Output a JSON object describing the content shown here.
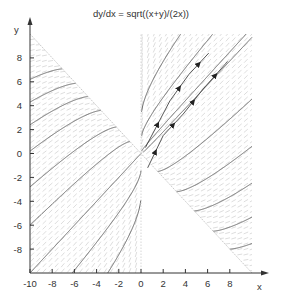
{
  "chart_data": {
    "type": "line",
    "title": "dy/dx = sqrt((x+y)/(2x))",
    "xlabel": "x",
    "ylabel": "y",
    "xlim": [
      -10,
      10
    ],
    "ylim": [
      -10,
      10
    ],
    "x_ticks": [
      -10,
      -8,
      -6,
      -4,
      -2,
      0,
      2,
      4,
      6,
      8
    ],
    "y_ticks": [
      -8,
      -6,
      -4,
      -2,
      0,
      2,
      4,
      6,
      8
    ],
    "grid": false,
    "legend": null,
    "annotations": [
      "slope field (direction field) shown in valid regions",
      "boundary line y = -x (dotted)",
      "boundary line x = 0 (dotted)"
    ],
    "solution_curves_right_start": [
      [
        0.05,
        0.2
      ],
      [
        0.2,
        0.1
      ],
      [
        0.05,
        1.5
      ],
      [
        1.5,
        -1.5
      ],
      [
        3.2,
        -3.2
      ],
      [
        4.8,
        -4.8
      ],
      [
        6.5,
        -6.5
      ],
      [
        8.0,
        -8.0
      ],
      [
        0.05,
        3.5
      ]
    ],
    "solution_curves_left_start": [
      [
        -10,
        6.2
      ],
      [
        -10,
        4.3
      ],
      [
        -10,
        2.4
      ],
      [
        -10,
        0.2
      ],
      [
        -10,
        -2.8
      ],
      [
        -10,
        -6.0
      ],
      [
        -10,
        -10.0
      ],
      [
        -6.2,
        -10
      ],
      [
        -3.0,
        -10
      ]
    ],
    "arrow_curves": [
      {
        "points": [
          [
            0.4,
            0.5
          ],
          [
            2.6,
            4.4
          ],
          [
            4.3,
            6.6
          ],
          [
            6.1,
            8.4
          ]
        ]
      },
      {
        "points": [
          [
            0.6,
            -1.2
          ],
          [
            2.0,
            1.5
          ],
          [
            3.8,
            3.3
          ],
          [
            5.6,
            5.4
          ],
          [
            7.8,
            7.7
          ]
        ]
      }
    ]
  }
}
